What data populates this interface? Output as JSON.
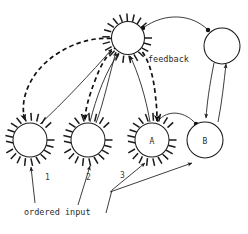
{
  "figure": {
    "title": "",
    "type": "node-link-diagram",
    "background": "#ffffff",
    "ink_color": "#1a1a1a"
  },
  "labels": {
    "feedback": "feedback",
    "ordered_input": "ordered input",
    "node_a": "A",
    "node_b": "B",
    "input_1": "1",
    "input_2": "2",
    "input_3": "3"
  },
  "nodes": [
    {
      "id": "top-sun",
      "label": "",
      "shape": "spiky-circle",
      "cx": 128,
      "cy": 38,
      "r": 16.5,
      "spikes": 20
    },
    {
      "id": "top-right",
      "label": "",
      "shape": "circle",
      "cx": 222,
      "cy": 46,
      "r": 18,
      "spikes": 0
    },
    {
      "id": "node-1",
      "label": "",
      "shape": "spiky-circle",
      "cx": 30,
      "cy": 140,
      "r": 17,
      "spikes": 20
    },
    {
      "id": "node-2",
      "label": "",
      "shape": "spiky-circle",
      "cx": 88,
      "cy": 140,
      "r": 17,
      "spikes": 20
    },
    {
      "id": "node-a",
      "label": "A",
      "shape": "spiky-circle",
      "cx": 152,
      "cy": 140,
      "r": 17,
      "spikes": 20
    },
    {
      "id": "node-b",
      "label": "B",
      "shape": "circle",
      "cx": 205,
      "cy": 140,
      "r": 18,
      "spikes": 0
    }
  ],
  "edges": [
    {
      "from": "top-sun",
      "to": "top-right",
      "style": "solid",
      "endpoints": "dot-dot"
    },
    {
      "from": "node-1",
      "to": "top-sun",
      "style": "solid",
      "endpoints": "arrow"
    },
    {
      "from": "node-2",
      "to": "top-sun",
      "style": "solid",
      "endpoints": "arrow"
    },
    {
      "from": "node-a",
      "to": "top-sun",
      "style": "solid",
      "endpoints": "arrow"
    },
    {
      "from": "top-sun",
      "to": "node-1",
      "style": "dashed",
      "endpoints": "arrow"
    },
    {
      "from": "top-sun",
      "to": "node-2",
      "style": "dashed",
      "endpoints": "arrow"
    },
    {
      "from": "top-sun",
      "to": "node-a",
      "style": "dashed",
      "endpoints": "arrow"
    },
    {
      "from": "node-a",
      "to": "node-b",
      "style": "solid",
      "endpoints": "dot"
    },
    {
      "from": "top-right",
      "to": "node-b",
      "style": "solid",
      "endpoints": "arrow"
    },
    {
      "from": "node-b",
      "to": "top-right",
      "style": "solid",
      "endpoints": "arrow"
    },
    {
      "from": "ordered-input",
      "to": "node-1",
      "style": "solid",
      "endpoints": "arrow",
      "tag": "1"
    },
    {
      "from": "ordered-input",
      "to": "node-2",
      "style": "solid",
      "endpoints": "arrow",
      "tag": "2"
    },
    {
      "from": "ordered-input",
      "to": "node-a",
      "style": "solid",
      "endpoints": "arrow",
      "tag": "3"
    },
    {
      "from": "ordered-input",
      "to": "node-b",
      "style": "solid",
      "endpoints": "arrow",
      "tag": ""
    }
  ]
}
